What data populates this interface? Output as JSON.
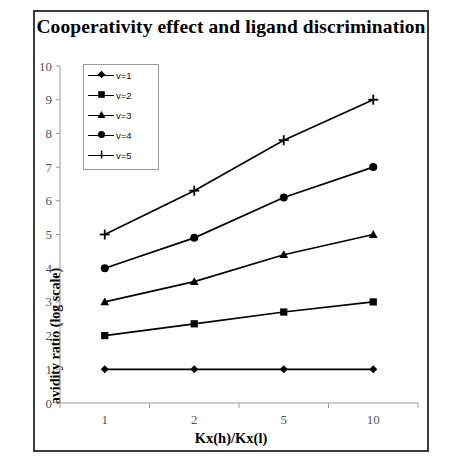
{
  "chart_data": {
    "type": "line",
    "title": "Cooperativity effect and ligand discrimination",
    "xlabel": "Kx(h)/Kx(l)",
    "ylabel": "avidity ratio (log scale)",
    "categories": [
      "1",
      "2",
      "5",
      "10"
    ],
    "xtick_labels": [
      "1",
      "2",
      "5",
      "10"
    ],
    "ytick_labels": [
      "0",
      "1",
      "2",
      "3",
      "4",
      "5",
      "6",
      "7",
      "8",
      "9",
      "10"
    ],
    "ylim": [
      0,
      10
    ],
    "yticks": [
      0,
      1,
      2,
      3,
      4,
      5,
      6,
      7,
      8,
      9,
      10
    ],
    "grid": false,
    "legend_position": "upper-left-inside",
    "series": [
      {
        "name": "v=1",
        "marker": "diamond",
        "values": [
          1.0,
          1.0,
          1.0,
          1.0
        ]
      },
      {
        "name": "v=2",
        "marker": "square",
        "values": [
          2.0,
          2.35,
          2.7,
          3.0
        ]
      },
      {
        "name": "v=3",
        "marker": "triangle",
        "values": [
          3.0,
          3.6,
          4.4,
          5.0
        ]
      },
      {
        "name": "v=4",
        "marker": "circle",
        "values": [
          4.0,
          4.9,
          6.1,
          7.0
        ]
      },
      {
        "name": "v=5",
        "marker": "plus",
        "values": [
          5.0,
          6.3,
          7.8,
          9.0
        ]
      }
    ]
  },
  "colors": {
    "line": "#000000",
    "axis": "#9a9a9a",
    "tick_text": "#555555",
    "frame": "#3b3b3b",
    "background": "#ffffff"
  }
}
